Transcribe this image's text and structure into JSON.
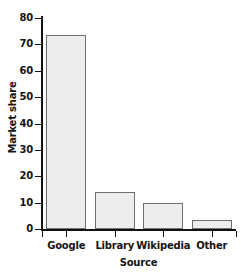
{
  "chart_data": {
    "type": "bar",
    "title": "",
    "xlabel": "Source",
    "ylabel": "Market share",
    "categories": [
      "Google",
      "Library",
      "Wikipedia",
      "Other"
    ],
    "values": [
      73.5,
      14.0,
      9.8,
      3.6
    ],
    "ylim": [
      0,
      80
    ],
    "yticks": [
      0,
      10,
      20,
      30,
      40,
      50,
      60,
      70,
      80
    ],
    "ytick_labels": [
      "0",
      "10",
      "20",
      "30",
      "40",
      "50",
      "60",
      "70",
      "80"
    ],
    "grid": false,
    "legend": "none",
    "bar_fill_color": "#ededed",
    "bar_edge_color": "#6f6f6f",
    "axis_color": "#111111",
    "background_color": "#ffffff"
  }
}
